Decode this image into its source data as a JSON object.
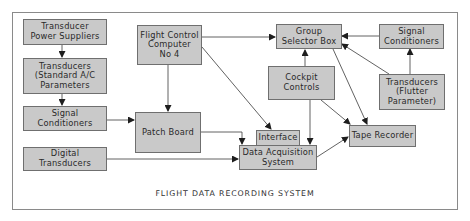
{
  "diagram": {
    "caption": "FLIGHT DATA RECORDING SYSTEM",
    "colors": {
      "box_fill": "#c9c9c9",
      "box_border": "#6f6f6f",
      "line": "#2a2a2a",
      "frame": "#8a8a8a"
    },
    "nodes": {
      "transducer_power": "Transducer\nPower Suppliers",
      "transducers_std": "Transducers\n(Standard A/C\nParameters",
      "signal_cond_left": "Signal\nConditioners",
      "digital_transducers": "Digital\nTransducers",
      "flight_control": "Flight Control\nComputer\nNo 4",
      "patch_board": "Patch Board",
      "interface": "Interface",
      "data_acquisition": "Data Acquisition\nSystem",
      "group_selector": "Group\nSelector Box",
      "signal_cond_right": "Signal\nConditioners",
      "cockpit_controls": "Cockpit\nControls",
      "transducers_flutter": "Transducers\n(Flutter\nParameter)",
      "tape_recorder": "Tape Recorder"
    },
    "edges": [
      [
        "Transducer Power Suppliers",
        "Transducers (Standard A/C Parameters"
      ],
      [
        "Transducers (Standard A/C Parameters",
        "Signal Conditioners (left)"
      ],
      [
        "Signal Conditioners (left)",
        "Patch Board"
      ],
      [
        "Flight Control Computer No 4",
        "Patch Board"
      ],
      [
        "Flight Control Computer No 4",
        "Group Selector Box"
      ],
      [
        "Flight Control Computer No 4",
        "Interface"
      ],
      [
        "Patch Board",
        "Data Acquisition System"
      ],
      [
        "Digital Transducers",
        "Data Acquisition System"
      ],
      [
        "Cockpit Controls",
        "Group Selector Box"
      ],
      [
        "Cockpit Controls",
        "Data Acquisition System"
      ],
      [
        "Cockpit Controls",
        "Tape Recorder"
      ],
      [
        "Signal Conditioners (right)",
        "Group Selector Box"
      ],
      [
        "Transducers (Flutter Parameter)",
        "Signal Conditioners (right)"
      ],
      [
        "Transducers (Flutter Parameter)",
        "Group Selector Box"
      ],
      [
        "Group Selector Box",
        "Tape Recorder"
      ],
      [
        "Data Acquisition System",
        "Tape Recorder"
      ]
    ]
  }
}
